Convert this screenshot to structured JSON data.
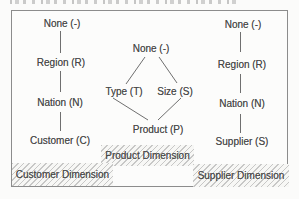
{
  "figure": {
    "customer": {
      "nodes": [
        "None (-)",
        "Region (R)",
        "Nation (N)",
        "Customer (C)"
      ],
      "label": "Customer Dimension"
    },
    "product": {
      "top": "None (-)",
      "left": "Type (T)",
      "right": "Size (S)",
      "bottom": "Product (P)",
      "label": "Product Dimension"
    },
    "supplier": {
      "nodes": [
        "None (-)",
        "Region (R)",
        "Nation (N)",
        "Supplier (S)"
      ],
      "label": "Supplier Dimension"
    }
  },
  "colors": {
    "text": "#494949",
    "connector": "#6f6f6f",
    "border": "#8c8c8c",
    "hatch_stripe": "#c3c3c3",
    "hatch_background": "#f7f7f5",
    "page_background": "#fbfbfa"
  }
}
